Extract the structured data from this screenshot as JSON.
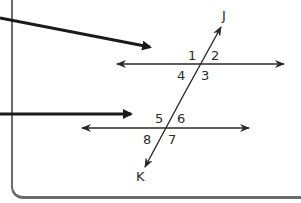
{
  "diagram": {
    "transversal": {
      "top_label": "J",
      "bottom_label": "K"
    },
    "upper_intersection": {
      "angles": [
        "1",
        "2",
        "3",
        "4"
      ]
    },
    "lower_intersection": {
      "angles": [
        "5",
        "6",
        "7",
        "8"
      ]
    },
    "colors": {
      "line": "#2a2a2a",
      "frame": "#6b6b6b",
      "background": "#ffffff"
    }
  }
}
